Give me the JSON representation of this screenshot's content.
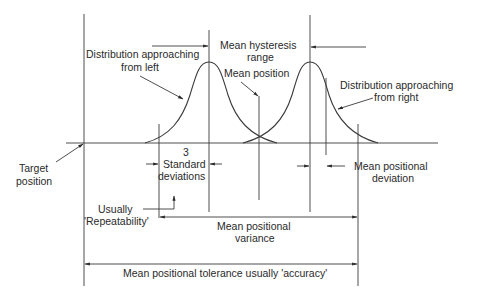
{
  "diagram": {
    "type": "positioning-accuracy-distributions",
    "labels": {
      "dist_left_1": "Distribution approaching",
      "dist_left_2": "from left",
      "hysteresis_1": "Mean hysteresis",
      "hysteresis_2": "range",
      "mean_position": "Mean position",
      "dist_right_1": "Distribution approaching",
      "dist_right_2": "from right",
      "target_1": "Target",
      "target_2": "position",
      "std_1": "3",
      "std_2": "Standard",
      "std_3": "deviations",
      "mean_dev_1": "Mean positional",
      "mean_dev_2": "deviation",
      "repeat_1": "Usually",
      "repeat_2": "'Repeatability'",
      "variance_1": "Mean positional",
      "variance_2": "variance",
      "tolerance": "Mean positional tolerance usually 'accuracy'"
    },
    "colors": {
      "line": "#3a3a3a",
      "text": "#2a2a2a",
      "background": "#ffffff"
    }
  }
}
